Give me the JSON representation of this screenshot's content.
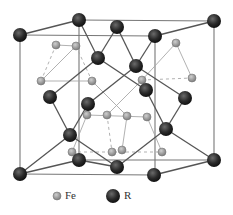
{
  "diagram": {
    "type": "crystal-structure",
    "colors": {
      "r_atom": "#2a2a2a",
      "fe_atom": "#9a9a9a",
      "bond": "#555555",
      "fe_bond": "#a8a8a8",
      "cell_edge": "#777777"
    },
    "cell_front": [
      [
        20,
        35
      ],
      [
        155,
        36
      ],
      [
        155,
        175
      ],
      [
        20,
        174
      ]
    ],
    "cell_back": [
      [
        79,
        20
      ],
      [
        214,
        21
      ],
      [
        214,
        160
      ],
      [
        79,
        160
      ]
    ],
    "r_atoms": [
      [
        20,
        35
      ],
      [
        79,
        20
      ],
      [
        117,
        27
      ],
      [
        155,
        36
      ],
      [
        214,
        21
      ],
      [
        98,
        58
      ],
      [
        136,
        66
      ],
      [
        50,
        97
      ],
      [
        146,
        90
      ],
      [
        185,
        98
      ],
      [
        88,
        104
      ],
      [
        70,
        135
      ],
      [
        166,
        129
      ],
      [
        20,
        174
      ],
      [
        79,
        160
      ],
      [
        117,
        167
      ],
      [
        154,
        175
      ],
      [
        214,
        160
      ]
    ],
    "fe_atoms": [
      [
        56,
        45
      ],
      [
        76,
        46
      ],
      [
        41,
        81
      ],
      [
        92,
        81
      ],
      [
        176,
        43
      ],
      [
        192,
        78
      ],
      [
        142,
        80
      ],
      [
        87,
        115
      ],
      [
        107,
        115
      ],
      [
        127,
        116
      ],
      [
        147,
        117
      ],
      [
        72,
        152
      ],
      [
        112,
        152
      ],
      [
        122,
        150
      ],
      [
        162,
        152
      ]
    ],
    "r_bonds": [
      [
        [
          20,
          35
        ],
        [
          79,
          20
        ]
      ],
      [
        [
          155,
          36
        ],
        [
          214,
          21
        ]
      ],
      [
        [
          79,
          20
        ],
        [
          98,
          58
        ]
      ],
      [
        [
          117,
          27
        ],
        [
          98,
          58
        ]
      ],
      [
        [
          117,
          27
        ],
        [
          136,
          66
        ]
      ],
      [
        [
          155,
          36
        ],
        [
          136,
          66
        ]
      ],
      [
        [
          98,
          58
        ],
        [
          50,
          97
        ]
      ],
      [
        [
          98,
          58
        ],
        [
          146,
          90
        ]
      ],
      [
        [
          136,
          66
        ],
        [
          88,
          104
        ]
      ],
      [
        [
          136,
          66
        ],
        [
          185,
          98
        ]
      ],
      [
        [
          50,
          97
        ],
        [
          70,
          135
        ]
      ],
      [
        [
          88,
          104
        ],
        [
          70,
          135
        ]
      ],
      [
        [
          146,
          90
        ],
        [
          166,
          129
        ]
      ],
      [
        [
          185,
          98
        ],
        [
          166,
          129
        ]
      ],
      [
        [
          70,
          135
        ],
        [
          20,
          174
        ]
      ],
      [
        [
          70,
          135
        ],
        [
          117,
          167
        ]
      ],
      [
        [
          166,
          129
        ],
        [
          117,
          167
        ]
      ],
      [
        [
          166,
          129
        ],
        [
          214,
          160
        ]
      ],
      [
        [
          20,
          174
        ],
        [
          79,
          160
        ]
      ],
      [
        [
          154,
          175
        ],
        [
          214,
          160
        ]
      ],
      [
        [
          79,
          160
        ],
        [
          117,
          167
        ]
      ]
    ],
    "fe_bonds": [
      [
        [
          56,
          45
        ],
        [
          76,
          46
        ]
      ],
      [
        [
          56,
          45
        ],
        [
          41,
          81
        ]
      ],
      [
        [
          76,
          46
        ],
        [
          41,
          81
        ]
      ],
      [
        [
          41,
          81
        ],
        [
          92,
          81
        ]
      ],
      [
        [
          76,
          46
        ],
        [
          92,
          81
        ]
      ],
      [
        [
          176,
          43
        ],
        [
          192,
          78
        ]
      ],
      [
        [
          176,
          43
        ],
        [
          142,
          80
        ]
      ],
      [
        [
          142,
          80
        ],
        [
          192,
          78
        ]
      ],
      [
        [
          87,
          115
        ],
        [
          147,
          117
        ]
      ],
      [
        [
          87,
          115
        ],
        [
          72,
          152
        ]
      ],
      [
        [
          107,
          115
        ],
        [
          112,
          152
        ]
      ],
      [
        [
          127,
          116
        ],
        [
          122,
          150
        ]
      ],
      [
        [
          147,
          117
        ],
        [
          162,
          152
        ]
      ],
      [
        [
          72,
          152
        ],
        [
          162,
          152
        ]
      ],
      [
        [
          92,
          81
        ],
        [
          127,
          116
        ]
      ],
      [
        [
          142,
          80
        ],
        [
          107,
          115
        ]
      ]
    ]
  },
  "legend": {
    "fe_label": "Fe",
    "r_label": "R"
  }
}
